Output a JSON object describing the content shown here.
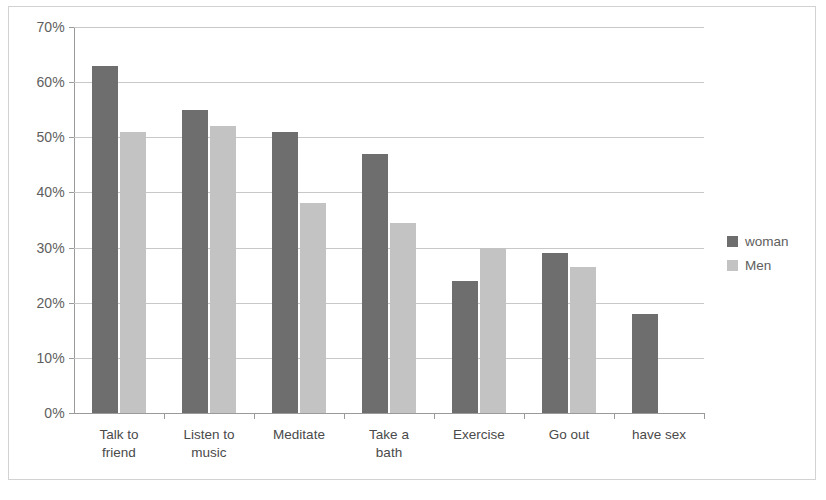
{
  "chart_data": {
    "type": "bar",
    "title": "",
    "subtitle": "",
    "xlabel": "",
    "ylabel": "",
    "grid": true,
    "legend_position": "right",
    "ylim": [
      0,
      70
    ],
    "ytick_labels": [
      "0%",
      "10%",
      "20%",
      "30%",
      "40%",
      "50%",
      "60%",
      "70%"
    ],
    "ytick_values": [
      0,
      10,
      20,
      30,
      40,
      50,
      60,
      70
    ],
    "categories": [
      "Talk to\nfriend",
      "Listen to\nmusic",
      "Meditate",
      "Take a\nbath",
      "Exercise",
      "Go out",
      "have sex"
    ],
    "series": [
      {
        "name": "woman",
        "color": "#6e6e6e",
        "values": [
          63,
          55,
          51,
          47,
          24,
          29,
          18
        ]
      },
      {
        "name": "Men",
        "color": "#c3c3c3",
        "values": [
          51,
          52,
          38,
          34.5,
          30,
          26.5,
          null
        ]
      }
    ]
  },
  "legend": {
    "items": [
      {
        "label": "woman",
        "color": "#6e6e6e"
      },
      {
        "label": "Men",
        "color": "#c3c3c3"
      }
    ]
  },
  "colors": {
    "women_bar": "#6e6e6e",
    "men_bar": "#c3c3c3",
    "gridline": "#c8c8c8",
    "axis": "#9a9a9a",
    "frame_border": "#d2d2d2",
    "text": "#5e5e5e",
    "background": "#ffffff"
  }
}
